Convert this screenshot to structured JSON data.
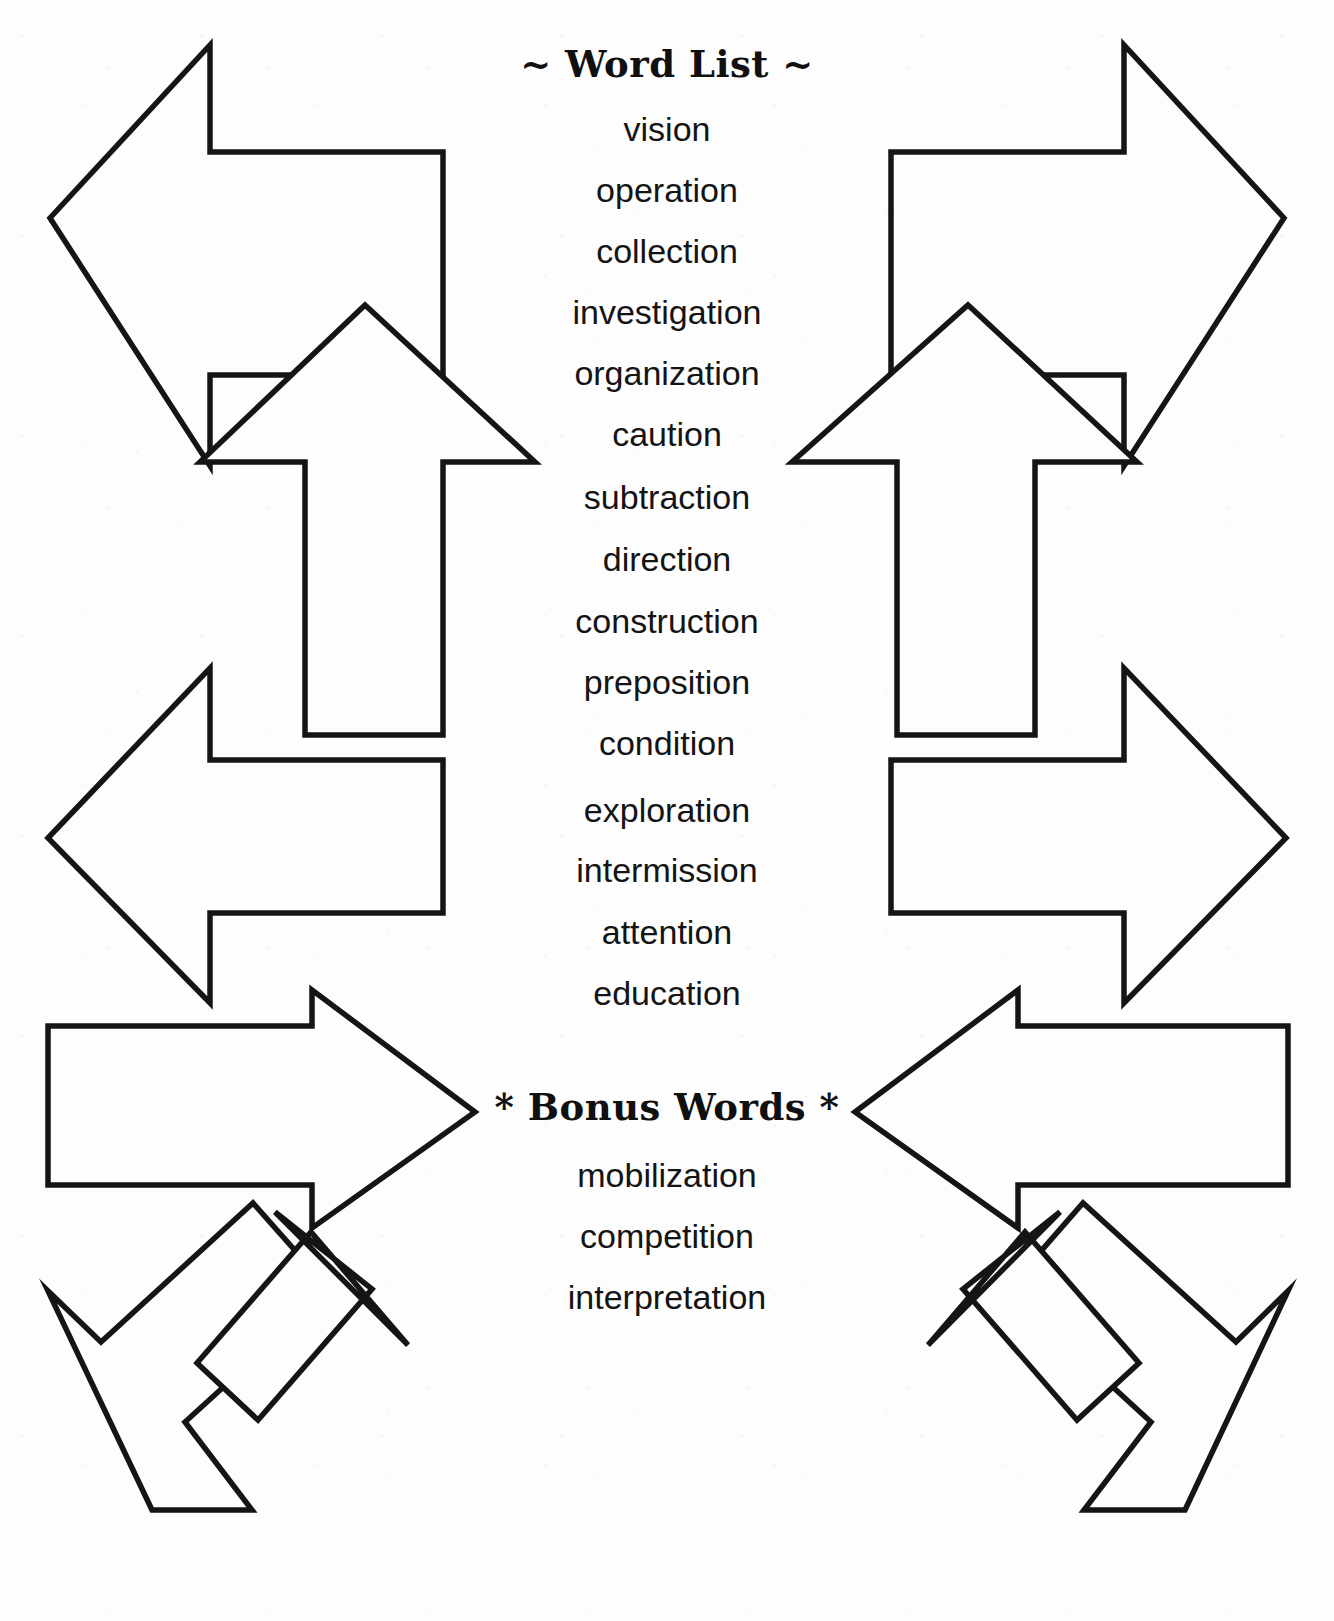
{
  "page": {
    "background_color": "#fdfdfd",
    "ink_color": "#151515"
  },
  "word_list": {
    "title": "~ Word List ~",
    "words": [
      "vision",
      "operation",
      "collection",
      "investigation",
      "organization",
      "caution",
      "subtraction",
      "direction",
      "construction",
      "preposition",
      "condition",
      "exploration",
      "intermission",
      "attention",
      "education"
    ]
  },
  "bonus_words": {
    "title": "* Bonus Words *",
    "words": [
      "mobilization",
      "competition",
      "interpretation"
    ]
  },
  "decorations": {
    "arrows": [
      {
        "name": "arrow-top-left-pointing-left",
        "direction": "left"
      },
      {
        "name": "arrow-top-right-pointing-right",
        "direction": "right"
      },
      {
        "name": "arrow-upper-left-pointing-up",
        "direction": "up"
      },
      {
        "name": "arrow-upper-right-pointing-up",
        "direction": "up"
      },
      {
        "name": "arrow-middle-left-pointing-left",
        "direction": "left"
      },
      {
        "name": "arrow-middle-right-pointing-right",
        "direction": "right"
      },
      {
        "name": "arrow-lower-left-pointing-right",
        "direction": "right"
      },
      {
        "name": "arrow-lower-right-pointing-left",
        "direction": "left"
      },
      {
        "name": "arrow-bottom-left-pointing-down",
        "direction": "down"
      },
      {
        "name": "arrow-bottom-right-pointing-down",
        "direction": "down"
      },
      {
        "name": "arrow-bottom-left-diagonal",
        "direction": "down-right"
      },
      {
        "name": "arrow-bottom-right-diagonal",
        "direction": "down-left"
      }
    ]
  }
}
